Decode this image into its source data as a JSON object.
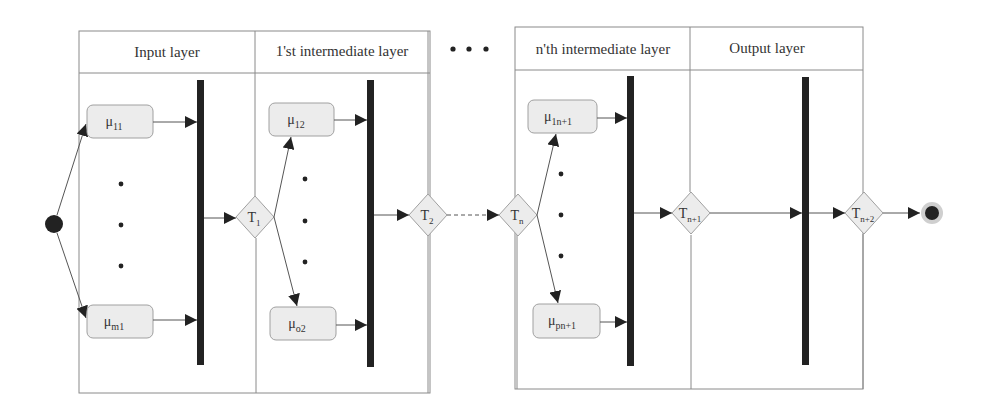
{
  "diagram": {
    "type": "activity-swimlane",
    "colors": {
      "background": "#ffffff",
      "lane_border": "#8a8a8a",
      "box_fill": "#ececec",
      "box_border": "#a0a0a0",
      "bar": "#222222",
      "line": "#555555",
      "text": "#333333"
    },
    "ellipsis_between_groups": "• • •",
    "lanes": [
      {
        "id": "input",
        "title": "Input layer"
      },
      {
        "id": "inter1",
        "title": "1'st intermediate layer"
      },
      {
        "id": "intern",
        "title": "n'th intermediate layer"
      },
      {
        "id": "output",
        "title": "Output layer"
      }
    ],
    "nodes": {
      "mu11": {
        "symbol": "μ",
        "sub": "11"
      },
      "mum1": {
        "symbol": "μ",
        "sub": "m1"
      },
      "mu12": {
        "symbol": "μ",
        "sub": "12"
      },
      "muo2": {
        "symbol": "μ",
        "sub": "o2"
      },
      "mu1n1": {
        "symbol": "μ",
        "sub": "1n+1"
      },
      "mupn1": {
        "symbol": "μ",
        "sub": "pn+1"
      }
    },
    "transitions": {
      "t1": {
        "symbol": "T",
        "sub": "1"
      },
      "t2": {
        "symbol": "T",
        "sub": "2"
      },
      "tn": {
        "symbol": "T",
        "sub": "n"
      },
      "tn1": {
        "symbol": "T",
        "sub": "n+1"
      },
      "tn2": {
        "symbol": "T",
        "sub": "n+2"
      }
    },
    "start_node": "initial-node",
    "end_node": "final-node"
  }
}
